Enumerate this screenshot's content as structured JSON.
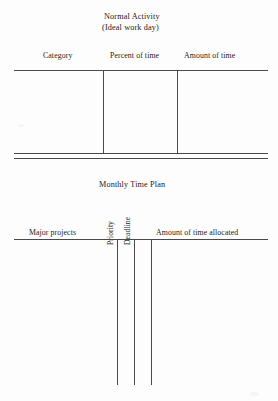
{
  "document": {
    "kind": "worksheet-page",
    "background_color": "#fdfdfd",
    "rule_color": "#4a4a4a",
    "text_color": "#222222"
  },
  "table_normal_activity": {
    "title_line1": "Normal Activity",
    "title_line2": "(Ideal work day)",
    "columns": [
      {
        "label": "Category"
      },
      {
        "label": "Percent of time"
      },
      {
        "label": "Amount of time"
      }
    ],
    "rows": [],
    "row_count_visible": 0,
    "bottom_rule_style": "double"
  },
  "table_monthly_time_plan": {
    "title": "Monthly Time Plan",
    "columns": [
      {
        "label": "Major projects",
        "orientation": "horizontal"
      },
      {
        "label": "Priority",
        "orientation": "vertical"
      },
      {
        "label": "Deadline",
        "orientation": "vertical"
      },
      {
        "label": "Amount of time allocated",
        "orientation": "horizontal"
      }
    ],
    "rows": [],
    "row_count_visible": 0,
    "bottom_rule_style": "none"
  }
}
